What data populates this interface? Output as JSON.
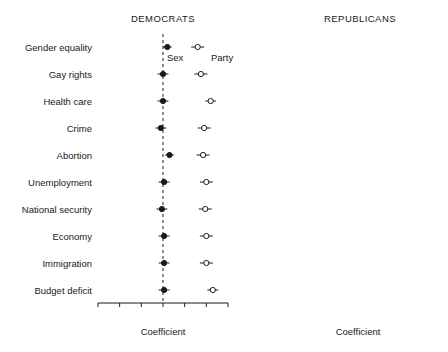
{
  "figure": {
    "background": "#ffffff",
    "foreground": "#1a1a1a"
  },
  "panels": [
    {
      "id": "democrats",
      "title": "DEMOCRATS"
    },
    {
      "id": "republicans",
      "title": "REPUBLICANS"
    }
  ],
  "annotations": {
    "sex_label": "Sex",
    "party_label": "Party"
  },
  "axis": {
    "xlabel_left": "Coefficient",
    "xlabel_right": "Coefficient",
    "ticklabels": [
      "-3",
      "-2",
      "-1",
      "0",
      "1",
      "2",
      "3"
    ],
    "tickvalues": [
      -3,
      -2,
      -1,
      0,
      1,
      2,
      3
    ],
    "xlim": [
      -3,
      3
    ],
    "reference_line": 0
  },
  "chart_data": {
    "type": "scatter",
    "title": "",
    "subtitle": "",
    "xlabel": "Coefficient",
    "ylabel": "",
    "xlim": [
      -3,
      3
    ],
    "xticks": [
      -3,
      -2,
      -1,
      0,
      1,
      2,
      3
    ],
    "grid": false,
    "legend_position": "inline-annotation",
    "legend": [
      "Sex",
      "Party"
    ],
    "reference_line_x": 0,
    "categories": [
      "Gender equality",
      "Gay rights",
      "Health care",
      "Crime",
      "Abortion",
      "Unemployment",
      "National security",
      "Economy",
      "Immigration",
      "Budget deficit"
    ],
    "panels": [
      {
        "name": "DEMOCRATS",
        "series": [
          {
            "name": "Sex",
            "marker": "filled-circle",
            "values": [
              0.2,
              0.0,
              0.0,
              -0.1,
              0.3,
              0.05,
              -0.05,
              0.05,
              0.05,
              0.05
            ],
            "ci_low": [
              0.0,
              -0.25,
              -0.25,
              -0.35,
              0.1,
              -0.2,
              -0.3,
              -0.2,
              -0.2,
              -0.2
            ],
            "ci_high": [
              0.4,
              0.25,
              0.25,
              0.15,
              0.5,
              0.3,
              0.2,
              0.3,
              0.3,
              0.3
            ]
          },
          {
            "name": "Party",
            "marker": "open-circle",
            "values": [
              1.6,
              1.75,
              2.2,
              1.9,
              1.85,
              2.0,
              1.95,
              2.0,
              2.0,
              2.3
            ],
            "ci_low": [
              1.3,
              1.45,
              1.95,
              1.6,
              1.55,
              1.7,
              1.65,
              1.7,
              1.7,
              2.05
            ],
            "ci_high": [
              1.9,
              2.05,
              2.45,
              2.2,
              2.15,
              2.3,
              2.25,
              2.3,
              2.3,
              2.55
            ]
          }
        ]
      },
      {
        "name": "REPUBLICANS",
        "series": [
          {
            "name": "Sex",
            "marker": "filled-circle",
            "values": [
              0.7,
              0.05,
              0.1,
              0.0,
              0.2,
              0.1,
              -0.05,
              0.1,
              0.1,
              0.05
            ],
            "ci_low": [
              0.35,
              -0.3,
              -0.25,
              -0.3,
              -0.1,
              -0.2,
              -0.35,
              -0.2,
              -0.2,
              -0.25
            ],
            "ci_high": [
              1.05,
              0.4,
              0.45,
              0.3,
              0.5,
              0.4,
              0.25,
              0.4,
              0.4,
              0.35
            ]
          },
          {
            "name": "Party",
            "marker": "open-circle",
            "values": [
              1.8,
              1.9,
              2.05,
              1.9,
              1.95,
              2.0,
              1.9,
              2.0,
              2.05,
              2.1
            ],
            "ci_low": [
              1.5,
              1.6,
              1.8,
              1.6,
              1.65,
              1.7,
              1.6,
              1.7,
              1.75,
              1.85
            ],
            "ci_high": [
              2.1,
              2.2,
              2.3,
              2.2,
              2.25,
              2.3,
              2.2,
              2.3,
              2.35,
              2.35
            ]
          }
        ]
      }
    ]
  }
}
